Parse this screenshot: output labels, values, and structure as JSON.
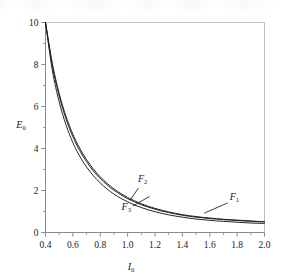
{
  "figure": {
    "name": "E0-vs-I0-decay-curves"
  },
  "chart_data": {
    "type": "line",
    "title": "",
    "xlabel": "I0",
    "ylabel": "E0",
    "xlabel_base": "I",
    "xlabel_sub": "0",
    "ylabel_base": "E",
    "ylabel_sub": "0",
    "xlim": [
      0.4,
      2.0
    ],
    "ylim": [
      0,
      10
    ],
    "grid": false,
    "legend": "inline-annotations",
    "xticks": [
      0.4,
      0.6,
      0.8,
      1.0,
      1.2,
      1.4,
      1.6,
      1.8,
      2.0
    ],
    "xticklabels": [
      "0.4",
      "0.6",
      "0.8",
      "1.0",
      "1.2",
      "1.4",
      "1.6",
      "1.8",
      "2.0"
    ],
    "xminorticks": [
      0.5,
      0.7,
      0.9,
      1.1,
      1.3,
      1.5,
      1.7,
      1.9
    ],
    "yticks": [
      0,
      2,
      4,
      6,
      8,
      10
    ],
    "yticklabels": [
      "0",
      "2",
      "4",
      "6",
      "8",
      "10"
    ],
    "yminorticks": [
      1,
      3,
      5,
      7,
      9
    ],
    "x": [
      0.4,
      0.45,
      0.5,
      0.55,
      0.6,
      0.65,
      0.7,
      0.75,
      0.8,
      0.85,
      0.9,
      0.95,
      1.0,
      1.05,
      1.1,
      1.15,
      1.2,
      1.25,
      1.3,
      1.35,
      1.4,
      1.45,
      1.5,
      1.55,
      1.6,
      1.65,
      1.7,
      1.75,
      1.8,
      1.85,
      1.9,
      1.95,
      2.0
    ],
    "series": [
      {
        "name": "F1",
        "label_base": "F",
        "label_sub": "1",
        "color": "#1a1a1a",
        "label_x": 1.78,
        "label_y": 1.55,
        "leader_to_x": 1.56,
        "leader_to_y": 0.92,
        "values": [
          10.0,
          8.05,
          6.62,
          5.53,
          4.68,
          4.01,
          3.47,
          3.02,
          2.65,
          2.34,
          2.08,
          1.86,
          1.67,
          1.51,
          1.37,
          1.25,
          1.15,
          1.06,
          0.98,
          0.91,
          0.85,
          0.8,
          0.76,
          0.72,
          0.69,
          0.66,
          0.63,
          0.61,
          0.59,
          0.57,
          0.55,
          0.53,
          0.52
        ]
      },
      {
        "name": "F2",
        "label_base": "F",
        "label_sub": "2",
        "color": "#1a1a1a",
        "label_x": 1.11,
        "label_y": 2.42,
        "leader_to_x": 1.02,
        "leader_to_y": 1.55,
        "values": [
          10.0,
          7.95,
          6.5,
          5.41,
          4.56,
          3.9,
          3.37,
          2.93,
          2.57,
          2.27,
          2.01,
          1.8,
          1.61,
          1.46,
          1.32,
          1.21,
          1.11,
          1.02,
          0.95,
          0.88,
          0.82,
          0.77,
          0.73,
          0.7,
          0.66,
          0.64,
          0.61,
          0.59,
          0.57,
          0.55,
          0.53,
          0.51,
          0.5
        ]
      },
      {
        "name": "F3",
        "label_base": "F",
        "label_sub": "3",
        "color": "#1a1a1a",
        "label_x": 0.99,
        "label_y": 1.08,
        "leader_to_x": 1.16,
        "leader_to_y": 1.72,
        "values": [
          10.0,
          7.72,
          6.22,
          5.12,
          4.28,
          3.63,
          3.12,
          2.7,
          2.36,
          2.07,
          1.83,
          1.63,
          1.46,
          1.31,
          1.19,
          1.08,
          0.99,
          0.91,
          0.84,
          0.78,
          0.73,
          0.68,
          0.64,
          0.61,
          0.58,
          0.55,
          0.53,
          0.51,
          0.49,
          0.47,
          0.45,
          0.44,
          0.42
        ]
      }
    ]
  },
  "style": {
    "frame_color": "#b8b8b8",
    "axis_color": "#8a8a8a",
    "curve_color": "#1a1a1a",
    "background": "#ffffff"
  }
}
